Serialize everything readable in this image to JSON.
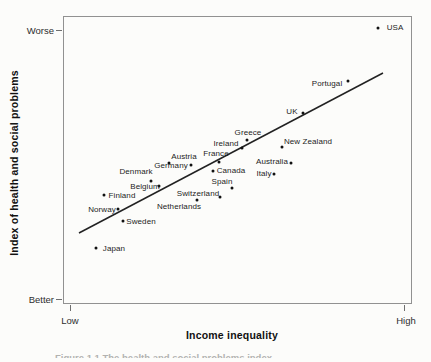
{
  "figure": {
    "y_axis_title": "Index of health and social problems",
    "x_axis_title": "Income inequality",
    "y_tick_top": "Worse",
    "y_tick_bottom": "Better",
    "x_tick_left": "Low",
    "x_tick_right": "High",
    "caption_fragment": "Figure 1.1 The health and social problems index"
  },
  "chart_data": {
    "type": "scatter",
    "title": "",
    "xlabel": "Income inequality",
    "ylabel": "Index of health and social problems",
    "x_axis": {
      "scale": "qualitative",
      "min_label": "Low",
      "max_label": "High",
      "range": [
        0,
        1
      ]
    },
    "y_axis": {
      "scale": "qualitative",
      "min_label": "Better",
      "max_label": "Worse",
      "range": [
        0,
        1
      ]
    },
    "grid": false,
    "legend": false,
    "marker_color": "#111111",
    "trend_color": "#222222",
    "points": [
      {
        "label": "USA",
        "inequality": 0.9,
        "problems": 0.96,
        "x": 378,
        "y": 28,
        "lx": 395,
        "ly": 28
      },
      {
        "label": "Portugal",
        "inequality": 0.81,
        "problems": 0.77,
        "x": 348,
        "y": 81,
        "lx": 327,
        "ly": 84
      },
      {
        "label": "UK",
        "inequality": 0.69,
        "problems": 0.66,
        "x": 303,
        "y": 113,
        "lx": 292,
        "ly": 112
      },
      {
        "label": "Greece",
        "inequality": 0.53,
        "problems": 0.57,
        "x": 247,
        "y": 140,
        "lx": 248,
        "ly": 133
      },
      {
        "label": "New Zealand",
        "inequality": 0.63,
        "problems": 0.55,
        "x": 282,
        "y": 147,
        "lx": 308,
        "ly": 142
      },
      {
        "label": "Ireland",
        "inequality": 0.51,
        "problems": 0.54,
        "x": 242,
        "y": 148,
        "lx": 226,
        "ly": 144
      },
      {
        "label": "France",
        "inequality": 0.45,
        "problems": 0.49,
        "x": 219,
        "y": 162,
        "lx": 216,
        "ly": 154
      },
      {
        "label": "Austria",
        "inequality": 0.3,
        "problems": 0.49,
        "x": 169,
        "y": 163,
        "lx": 184,
        "ly": 157
      },
      {
        "label": "Australia",
        "inequality": 0.65,
        "problems": 0.49,
        "x": 291,
        "y": 163,
        "lx": 272,
        "ly": 162
      },
      {
        "label": "Germany",
        "inequality": 0.37,
        "problems": 0.48,
        "x": 191,
        "y": 165,
        "lx": 171,
        "ly": 166
      },
      {
        "label": "Canada",
        "inequality": 0.43,
        "problems": 0.46,
        "x": 213,
        "y": 171,
        "lx": 231,
        "ly": 171
      },
      {
        "label": "Italy",
        "inequality": 0.6,
        "problems": 0.45,
        "x": 274,
        "y": 174,
        "lx": 264,
        "ly": 174
      },
      {
        "label": "Denmark",
        "inequality": 0.25,
        "problems": 0.43,
        "x": 151,
        "y": 181,
        "lx": 136,
        "ly": 172
      },
      {
        "label": "Spain",
        "inequality": 0.48,
        "problems": 0.4,
        "x": 232,
        "y": 188,
        "lx": 222,
        "ly": 182
      },
      {
        "label": "Belgium",
        "inequality": 0.27,
        "problems": 0.41,
        "x": 159,
        "y": 186,
        "lx": 145,
        "ly": 187
      },
      {
        "label": "Finland",
        "inequality": 0.12,
        "problems": 0.38,
        "x": 104,
        "y": 195,
        "lx": 122,
        "ly": 196
      },
      {
        "label": "Switzerland",
        "inequality": 0.45,
        "problems": 0.37,
        "x": 220,
        "y": 197,
        "lx": 198,
        "ly": 194
      },
      {
        "label": "Netherlands",
        "inequality": 0.38,
        "problems": 0.36,
        "x": 197,
        "y": 200,
        "lx": 179,
        "ly": 207
      },
      {
        "label": "Norway",
        "inequality": 0.16,
        "problems": 0.33,
        "x": 118,
        "y": 209,
        "lx": 102,
        "ly": 210
      },
      {
        "label": "Sweden",
        "inequality": 0.17,
        "problems": 0.29,
        "x": 123,
        "y": 221,
        "lx": 141,
        "ly": 222
      },
      {
        "label": "Japan",
        "inequality": 0.09,
        "problems": 0.19,
        "x": 96,
        "y": 248,
        "lx": 114,
        "ly": 249
      }
    ],
    "trendline": {
      "x1": 79,
      "y1": 233,
      "x2": 383,
      "y2": 73
    }
  }
}
